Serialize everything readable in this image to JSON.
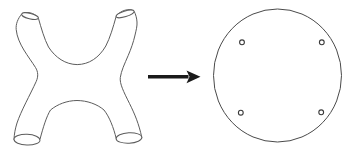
{
  "meta": {
    "background": "#ffffff"
  },
  "colors": {
    "surface_stroke": "#5c5c5c",
    "disk_stroke": "#4a4a4a",
    "puncture_stroke": "#3a3a3a",
    "arrow_color": "#1a1a1a"
  },
  "surface": {
    "body_path": "M 21.7 14 C 18 18.5 15.6 24 16.2 29.5 C 17.5 44 29 57 35.5 67.5 C 38.2 71.8 38.4 76.5 36.2 81.5 C 30 95 21 111 17 123 C 15.3 128.5 14.2 134 14 139.6 C 16.5 144.8 37 144.6 40 139.2 C 43 128 46.4 116.5 50.5 110 C 57.5 104.2 67 100.6 77 100.5 C 87 100.6 97 104 104 110 C 109.5 117 113.5 127.5 116.2 138.4 C 118 143.3 139.5 142.6 141.8 137.6 C 139 124 134.5 113.5 129.5 103.5 C 123.5 91.5 119.5 83.5 120.3 77.5 C 121.2 71 124.5 64 128.2 55.5 C 131.2 48.5 133.4 42 134.8 36 C 136.2 30 137.3 26 137 22 C 136.8 18.2 135.6 14 134.2 11.4 C 129.5 7.6 120 10.4 116.1 16.6 C 113.2 27 110 38 105.8 46 C 99 57.8 89 64.4 77.2 64.6 C 65.5 64.4 55.5 57.8 48.5 47 C 44.3 39 41.2 28 38.4 18.2 C 34.5 12.2 26 11.3 21.7 14 Z",
    "boundaries": [
      {
        "name": "top-left-opening",
        "transform": "translate(30,16.1) rotate(14)",
        "rx": 8.6,
        "ry": 2.7
      },
      {
        "name": "top-right-opening",
        "transform": "translate(125.1,13.9) rotate(-17)",
        "rx": 9.4,
        "ry": 2.8
      },
      {
        "name": "bottom-left-opening",
        "transform": "translate(27,139.7) rotate(2)",
        "rx": 13,
        "ry": 5.4
      },
      {
        "name": "bottom-right-opening",
        "transform": "translate(129,138) rotate(-3)",
        "rx": 12.9,
        "ry": 5.2
      }
    ]
  },
  "arrow": {
    "shaft_path": "M 148 76.8 L 188.5 76.8",
    "shaft_width": 3.6,
    "head_points": "186.5,70.4 200.5,76.8 186.5,83.2 189.5,76.8"
  },
  "disk": {
    "cx": 277.5,
    "cy": 75.5,
    "rx": 64,
    "ry": 66.5
  },
  "punctures": [
    {
      "cx": 242,
      "cy": 42.3,
      "r": 2.4
    },
    {
      "cx": 321.8,
      "cy": 42.3,
      "r": 2.4
    },
    {
      "cx": 240.8,
      "cy": 112.7,
      "r": 2.4
    },
    {
      "cx": 321.2,
      "cy": 112.3,
      "r": 2.4
    }
  ]
}
